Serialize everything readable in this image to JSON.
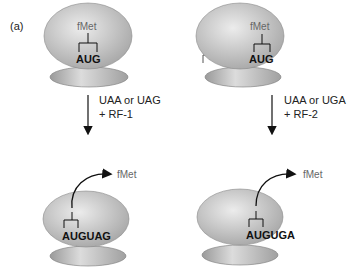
{
  "panels": {
    "a": {
      "label": "(a)",
      "top_residue": "fMet",
      "top_codon": "AUG",
      "condition_line1": "UAA or UAG",
      "condition_line2": "+ RF-1",
      "bottom_codon": "AUGUAG",
      "released": "fMet"
    },
    "b": {
      "label": "(b)",
      "top_residue": "fMet",
      "top_codon": "AUG",
      "condition_line1": "UAA or UGA",
      "condition_line2": "+ RF-2",
      "bottom_codon": "AUGUGA",
      "released": "fMet"
    }
  },
  "colors": {
    "ribosome_fill": "#bdbdbd",
    "ribosome_highlight": "#e6e6e6",
    "ribosome_edge": "#7a7a7a",
    "line": "#111111"
  }
}
